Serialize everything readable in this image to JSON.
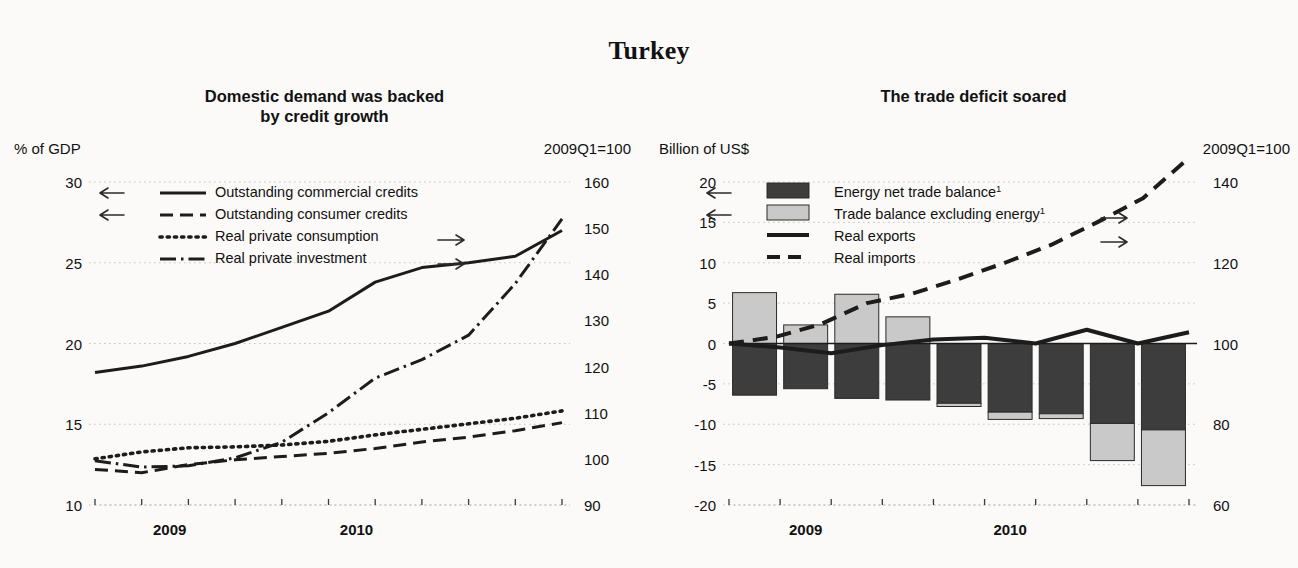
{
  "page": {
    "title": "Turkey"
  },
  "panels": [
    {
      "id": "left",
      "title_line1": "Domestic demand was backed",
      "title_line2": "by credit growth",
      "unit_left": "% of GDP",
      "unit_right": "2009Q1=100"
    },
    {
      "id": "right",
      "title_line1": "The trade deficit soared",
      "title_line2": "",
      "unit_left": "Billion of US$",
      "unit_right": "2009Q1=100"
    }
  ],
  "chart_data": [
    {
      "type": "line",
      "title": "Domestic demand was backed by credit growth",
      "xlabel": "",
      "ylabel": "% of GDP",
      "y2label": "2009Q1=100",
      "ylim": [
        10,
        30
      ],
      "yticks": [
        10,
        15,
        20,
        25,
        30
      ],
      "y2lim": [
        90,
        160
      ],
      "y2ticks": [
        90,
        100,
        110,
        120,
        130,
        140,
        150,
        160
      ],
      "grid": true,
      "legend_position": "upper-left",
      "x": [
        "2008Q4",
        "2009Q1",
        "2009Q2",
        "2009Q3",
        "2009Q4",
        "2010Q1",
        "2010Q2",
        "2010Q3",
        "2010Q4"
      ],
      "xticks_major": [
        "2009",
        "2010"
      ],
      "series": [
        {
          "name": "Outstanding commercial credits",
          "axis": "left",
          "style": "solid",
          "arrow": "left",
          "values": [
            18.2,
            18.6,
            19.2,
            20.0,
            21.0,
            22.0,
            23.8,
            24.7,
            25.0,
            25.4,
            27.0
          ]
        },
        {
          "name": "Outstanding consumer credits",
          "axis": "left",
          "style": "dashed",
          "arrow": "left",
          "values": [
            12.2,
            12.0,
            12.5,
            12.8,
            13.0,
            13.2,
            13.5,
            13.9,
            14.2,
            14.6,
            15.1
          ]
        },
        {
          "name": "Real private consumption",
          "axis": "right",
          "style": "dotted",
          "arrow": "right",
          "values": [
            100.0,
            101.5,
            102.4,
            102.6,
            103.0,
            103.8,
            105.2,
            106.4,
            107.6,
            108.8,
            110.4
          ]
        },
        {
          "name": "Real private investment",
          "axis": "right",
          "style": "dashdot",
          "arrow": "right",
          "values": [
            99.6,
            98.2,
            98.5,
            100.2,
            103.6,
            110.0,
            117.5,
            121.5,
            126.8,
            138.0,
            152.0
          ]
        }
      ]
    },
    {
      "type": "bar",
      "title": "The trade deficit soared",
      "xlabel": "",
      "ylabel": "Billion of US$",
      "y2label": "2009Q1=100",
      "ylim": [
        -20,
        20
      ],
      "yticks": [
        -20,
        -15,
        -10,
        -5,
        0,
        5,
        10,
        15,
        20
      ],
      "y2lim": [
        60,
        140
      ],
      "y2ticks": [
        60,
        80,
        100,
        120,
        140
      ],
      "grid": true,
      "stacked": true,
      "legend_position": "upper-left",
      "categories": [
        "2008Q4",
        "2009Q1",
        "2009Q2",
        "2009Q3",
        "2009Q4",
        "2010Q1",
        "2010Q2",
        "2010Q3",
        "2010Q4"
      ],
      "xticks_major": [
        "2009",
        "2010"
      ],
      "bar_series": [
        {
          "name": "Energy net trade balance",
          "footnote": "1",
          "color": "#3d3d3d",
          "axis": "left",
          "arrow": "left",
          "values": [
            -6.4,
            -5.6,
            -6.8,
            -7.0,
            -7.4,
            -8.5,
            -8.7,
            -9.9,
            -10.7
          ]
        },
        {
          "name": "Trade balance excluding energy",
          "footnote": "1",
          "color": "#c9c9c9",
          "axis": "left",
          "arrow": "left",
          "values": [
            6.3,
            2.3,
            6.1,
            3.3,
            -0.4,
            -0.9,
            -0.6,
            -4.6,
            -6.9
          ]
        }
      ],
      "line_series": [
        {
          "name": "Real exports",
          "axis": "right",
          "style": "solid",
          "arrow": "right",
          "values": [
            100.0,
            99.0,
            97.6,
            99.6,
            101.0,
            101.4,
            100.0,
            103.4,
            100.0,
            102.8
          ]
        },
        {
          "name": "Real imports",
          "axis": "right",
          "style": "dashed",
          "arrow": "right",
          "values": [
            100.0,
            101.6,
            104.8,
            110.0,
            112.4,
            116.0,
            120.0,
            124.4,
            130.0,
            136.0,
            146.0
          ]
        }
      ]
    }
  ]
}
